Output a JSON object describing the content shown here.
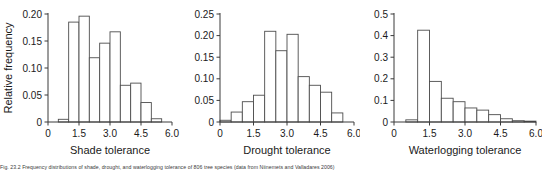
{
  "figure": {
    "caption": "Fig. 23.2 Frequency distributions of shade, drought, and waterlogging tolerance of 806 tree species (data from Niinemets and Valladares 2006)"
  },
  "chart_data": [
    {
      "type": "bar",
      "title": "",
      "xlabel": "Shade tolerance",
      "ylabel": "Relative frequency",
      "xlim": [
        0,
        6
      ],
      "ylim": [
        0,
        0.2
      ],
      "grid": false,
      "legend": "none",
      "bin_width": 0.5,
      "x_ticks": [
        "0",
        "1.5",
        "3.0",
        "4.5",
        "6.0"
      ],
      "x_tick_values": [
        0,
        1.5,
        3.0,
        4.5,
        6.0
      ],
      "y_ticks": [
        "0",
        "0.05",
        "0.10",
        "0.15",
        "0.20"
      ],
      "y_tick_values": [
        0,
        0.05,
        0.1,
        0.15,
        0.2
      ],
      "bin_starts": [
        0.5,
        1.0,
        1.5,
        2.0,
        2.5,
        3.0,
        3.5,
        4.0,
        4.5,
        5.0
      ],
      "categories": [
        "0.5-1.0",
        "1.0-1.5",
        "1.5-2.0",
        "2.0-2.5",
        "2.5-3.0",
        "3.0-3.5",
        "3.5-4.0",
        "4.0-4.5",
        "4.5-5.0",
        "5.0-5.5"
      ],
      "values": [
        0.005,
        0.185,
        0.196,
        0.119,
        0.146,
        0.167,
        0.068,
        0.072,
        0.036,
        0.006
      ]
    },
    {
      "type": "bar",
      "title": "",
      "xlabel": "Drought tolerance",
      "ylabel": "",
      "xlim": [
        0,
        6
      ],
      "ylim": [
        0,
        0.25
      ],
      "grid": false,
      "legend": "none",
      "bin_width": 0.5,
      "x_ticks": [
        "0",
        "1.5",
        "3.0",
        "4.5",
        "6.0"
      ],
      "x_tick_values": [
        0,
        1.5,
        3.0,
        4.5,
        6.0
      ],
      "y_ticks": [
        "0",
        "0.05",
        "0.10",
        "0.15",
        "0.20",
        "0.25"
      ],
      "y_tick_values": [
        0,
        0.05,
        0.1,
        0.15,
        0.2,
        0.25
      ],
      "bin_starts": [
        0.0,
        0.5,
        1.0,
        1.5,
        2.0,
        2.5,
        3.0,
        3.5,
        4.0,
        4.5,
        5.0
      ],
      "categories": [
        "0-0.5",
        "0.5-1.0",
        "1.0-1.5",
        "1.5-2.0",
        "2.0-2.5",
        "2.5-3.0",
        "3.0-3.5",
        "3.5-4.0",
        "4.0-4.5",
        "4.5-5.0",
        "5.0-5.5"
      ],
      "values": [
        0.004,
        0.023,
        0.047,
        0.062,
        0.21,
        0.165,
        0.203,
        0.105,
        0.085,
        0.069,
        0.021
      ]
    },
    {
      "type": "bar",
      "title": "",
      "xlabel": "Waterlogging tolerance",
      "ylabel": "",
      "xlim": [
        0,
        6
      ],
      "ylim": [
        0,
        0.5
      ],
      "grid": false,
      "legend": "none",
      "bin_width": 0.5,
      "x_ticks": [
        "0",
        "1.5",
        "3.0",
        "4.5",
        "6.0"
      ],
      "x_tick_values": [
        0,
        1.5,
        3.0,
        4.5,
        6.0
      ],
      "y_ticks": [
        "0",
        "0.1",
        "0.2",
        "0.3",
        "0.4",
        "0.5"
      ],
      "y_tick_values": [
        0,
        0.1,
        0.2,
        0.3,
        0.4,
        0.5
      ],
      "bin_starts": [
        0.5,
        1.0,
        1.5,
        2.0,
        2.5,
        3.0,
        3.5,
        4.0,
        4.5,
        5.0,
        5.5
      ],
      "categories": [
        "0.5-1.0",
        "1.0-1.5",
        "1.5-2.0",
        "2.0-2.5",
        "2.5-3.0",
        "3.0-3.5",
        "3.5-4.0",
        "4.0-4.5",
        "4.5-5.0",
        "5.0-5.5",
        "5.5-6.0"
      ],
      "values": [
        0.01,
        0.425,
        0.188,
        0.11,
        0.094,
        0.065,
        0.055,
        0.034,
        0.015,
        0.006,
        0.004
      ]
    }
  ]
}
